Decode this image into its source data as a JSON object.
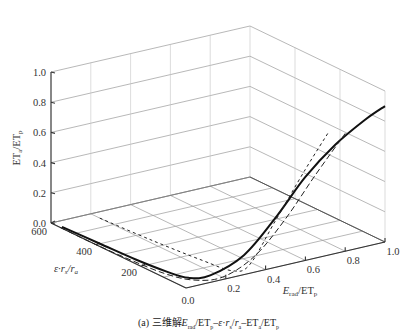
{
  "caption": "(a) 三维解E_rad/ET_p–ε·r_s/r_a–ET_a/ET_p",
  "chart_data": {
    "type": "line",
    "projection": "3d",
    "xlabel": "E_rad/ET_p",
    "ylabel": "ε·r_s/r_a",
    "zlabel": "ET_a/ET_p",
    "xlim": [
      0.0,
      1.0
    ],
    "ylim": [
      0,
      600
    ],
    "zlim": [
      0.0,
      1.0
    ],
    "x_ticks": [
      "0.0",
      "0.2",
      "0.4",
      "0.6",
      "0.8",
      "1.0"
    ],
    "y_ticks": [
      "600",
      "400",
      "200"
    ],
    "z_ticks": [
      "0.0",
      "0.2",
      "0.4",
      "0.6",
      "0.8",
      "1.0"
    ],
    "grid": true,
    "series": [
      {
        "name": "solid",
        "style": "solid",
        "points": [
          {
            "x": 0.01,
            "y": 560,
            "z": 0.0
          },
          {
            "x": 0.02,
            "y": 400,
            "z": 0.0
          },
          {
            "x": 0.03,
            "y": 250,
            "z": 0.0
          },
          {
            "x": 0.05,
            "y": 130,
            "z": 0.0
          },
          {
            "x": 0.08,
            "y": 60,
            "z": 0.0
          },
          {
            "x": 0.15,
            "y": 25,
            "z": 0.02
          },
          {
            "x": 0.3,
            "y": 8,
            "z": 0.12
          },
          {
            "x": 0.45,
            "y": 3,
            "z": 0.32
          },
          {
            "x": 0.6,
            "y": 1,
            "z": 0.55
          },
          {
            "x": 0.75,
            "y": 0,
            "z": 0.72
          },
          {
            "x": 0.9,
            "y": 0,
            "z": 0.84
          },
          {
            "x": 1.0,
            "y": 0,
            "z": 0.9
          }
        ]
      },
      {
        "name": "long-dash",
        "style": "dashed",
        "points": [
          {
            "x": 0.0,
            "y": 560,
            "z": 0.0
          },
          {
            "x": 0.0,
            "y": 400,
            "z": 0.0
          },
          {
            "x": 0.01,
            "y": 250,
            "z": 0.0
          },
          {
            "x": 0.03,
            "y": 120,
            "z": 0.0
          },
          {
            "x": 0.08,
            "y": 40,
            "z": 0.0
          },
          {
            "x": 0.2,
            "y": 15,
            "z": 0.0
          },
          {
            "x": 0.35,
            "y": 5,
            "z": 0.1
          },
          {
            "x": 0.5,
            "y": 2,
            "z": 0.3
          },
          {
            "x": 0.65,
            "y": 0,
            "z": 0.55
          },
          {
            "x": 0.8,
            "y": 0,
            "z": 0.78
          }
        ]
      },
      {
        "name": "short-dash",
        "style": "dotted",
        "points": [
          {
            "x": 0.2,
            "y": 560,
            "z": 0.0
          },
          {
            "x": 0.22,
            "y": 350,
            "z": 0.0
          },
          {
            "x": 0.25,
            "y": 150,
            "z": 0.0
          },
          {
            "x": 0.28,
            "y": 40,
            "z": 0.0
          },
          {
            "x": 0.33,
            "y": 8,
            "z": 0.05
          },
          {
            "x": 0.45,
            "y": 3,
            "z": 0.3
          },
          {
            "x": 0.6,
            "y": 1,
            "z": 0.6
          },
          {
            "x": 0.72,
            "y": 0,
            "z": 0.82
          }
        ]
      }
    ]
  }
}
